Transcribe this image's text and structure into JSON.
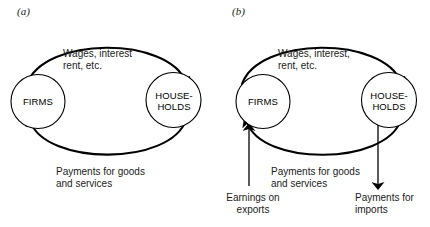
{
  "figure": {
    "type": "circular-flow-diagram",
    "background_color": "#ffffff",
    "line_color": "#000000",
    "panels": [
      {
        "id": "a",
        "label": "(a)",
        "nodes": [
          {
            "id": "firms",
            "label": "FIRMS"
          },
          {
            "id": "households",
            "label": "HOUSE-\nHOLDS"
          }
        ],
        "flows": [
          {
            "id": "wages",
            "label": "Wages, interest\nrent, etc.",
            "from": "firms",
            "to": "households",
            "path": "top-arc"
          },
          {
            "id": "payments-goods",
            "label": "Payments for goods\nand services",
            "from": "households",
            "to": "firms",
            "path": "bottom-arc"
          }
        ]
      },
      {
        "id": "b",
        "label": "(b)",
        "nodes": [
          {
            "id": "firms",
            "label": "FIRMS"
          },
          {
            "id": "households",
            "label": "HOUSE-\nHOLDS"
          }
        ],
        "flows": [
          {
            "id": "wages",
            "label": "Wages, interest,\nrent, etc.",
            "from": "firms",
            "to": "households",
            "path": "top-arc"
          },
          {
            "id": "payments-goods",
            "label": "Payments for goods\nand services",
            "from": "households",
            "to": "firms",
            "path": "bottom-arc"
          },
          {
            "id": "earnings-exports",
            "label": "Earnings on\nexports",
            "from": "external",
            "to": "firms",
            "path": "vertical-arrow-up"
          },
          {
            "id": "payments-imports",
            "label": "Payments for\nimports",
            "from": "households",
            "to": "external",
            "path": "vertical-arrow-down"
          }
        ]
      }
    ]
  }
}
